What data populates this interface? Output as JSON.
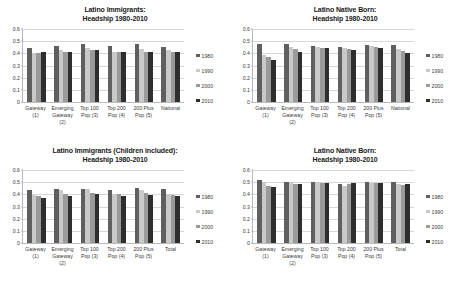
{
  "figure": {
    "background_color": "#ffffff",
    "series_colors": {
      "1980": "#5f5f5f",
      "1990": "#c9c9c9",
      "2000": "#9a9a9a",
      "2010": "#2e2e2e"
    },
    "legend_labels": [
      "1980",
      "1990",
      "2000",
      "2010"
    ],
    "yticks": [
      "0.6",
      "0.5",
      "0.4",
      "0.3",
      "0.2",
      "0.1",
      "0"
    ]
  },
  "chart_data": [
    {
      "type": "bar",
      "panel": "top-left",
      "title": "Latino Immigrants:",
      "subtitle": "Headship 1980-2010",
      "xlabel": "",
      "ylabel": "",
      "ylim": [
        0,
        0.6
      ],
      "ytick_values": [
        0,
        0.1,
        0.2,
        0.3,
        0.4,
        0.5,
        0.6
      ],
      "grid": true,
      "legend_position": "right",
      "categories": [
        [
          "Gateway",
          "(1)"
        ],
        [
          "Emerging",
          "Gateway",
          "(2)"
        ],
        [
          "Top 100",
          "Pop (3)"
        ],
        [
          "Top 200",
          "Pop (4)"
        ],
        [
          "200 Plus",
          "Pop (5)"
        ],
        [
          "National"
        ]
      ],
      "series": [
        {
          "name": "1980",
          "values": [
            0.44,
            0.46,
            0.48,
            0.46,
            0.48,
            0.455
          ]
        },
        {
          "name": "1990",
          "values": [
            0.4,
            0.43,
            0.44,
            0.415,
            0.435,
            0.425
          ]
        },
        {
          "name": "2000",
          "values": [
            0.4,
            0.41,
            0.425,
            0.41,
            0.415,
            0.41
          ]
        },
        {
          "name": "2010",
          "values": [
            0.41,
            0.41,
            0.425,
            0.415,
            0.415,
            0.41
          ]
        }
      ]
    },
    {
      "type": "bar",
      "panel": "top-right",
      "title": "Latino Native Born:",
      "subtitle": "Headship 1980-2010",
      "xlabel": "",
      "ylabel": "",
      "ylim": [
        0,
        0.6
      ],
      "ytick_values": [
        0,
        0.1,
        0.2,
        0.3,
        0.4,
        0.5,
        0.6
      ],
      "grid": true,
      "legend_position": "right",
      "categories": [
        [
          "Gateway",
          "(1)"
        ],
        [
          "Emerging",
          "Gateway",
          "(2)"
        ],
        [
          "Top 100",
          "Pop (3)"
        ],
        [
          "Top 200",
          "Pop (4)"
        ],
        [
          "200 Plus",
          "Pop (5)"
        ],
        [
          "National"
        ]
      ],
      "series": [
        {
          "name": "1980",
          "values": [
            0.48,
            0.478,
            0.458,
            0.452,
            0.465,
            0.472
          ]
        },
        {
          "name": "1990",
          "values": [
            0.39,
            0.455,
            0.45,
            0.442,
            0.458,
            0.432
          ]
        },
        {
          "name": "2000",
          "values": [
            0.37,
            0.432,
            0.442,
            0.438,
            0.452,
            0.418
          ]
        },
        {
          "name": "2010",
          "values": [
            0.345,
            0.41,
            0.44,
            0.428,
            0.445,
            0.4
          ]
        }
      ]
    },
    {
      "type": "bar",
      "panel": "bottom-left",
      "title": "Latino Immigrants (Children included):",
      "subtitle": "Headship 1980-2010",
      "xlabel": "",
      "ylabel": "",
      "ylim": [
        0,
        0.6
      ],
      "ytick_values": [
        0,
        0.1,
        0.2,
        0.3,
        0.4,
        0.5,
        0.6
      ],
      "grid": true,
      "legend_position": "right",
      "categories": [
        [
          "Gateway",
          "(1)"
        ],
        [
          "Emerging",
          "Gateway",
          "(2)"
        ],
        [
          "Top 100",
          "Pop (3)"
        ],
        [
          "Top 200",
          "Pop (4)"
        ],
        [
          "200 Plus",
          "Pop (5)"
        ],
        [
          "Total"
        ]
      ],
      "series": [
        {
          "name": "1980",
          "values": [
            0.437,
            0.445,
            0.447,
            0.432,
            0.452,
            0.44
          ]
        },
        {
          "name": "1990",
          "values": [
            0.392,
            0.435,
            0.44,
            0.405,
            0.437,
            0.405
          ]
        },
        {
          "name": "2000",
          "values": [
            0.385,
            0.405,
            0.408,
            0.4,
            0.412,
            0.392
          ]
        },
        {
          "name": "2010",
          "values": [
            0.368,
            0.39,
            0.4,
            0.388,
            0.392,
            0.383
          ]
        }
      ]
    },
    {
      "type": "bar",
      "panel": "bottom-right",
      "title": "Latino Native Born:",
      "subtitle": "Headship 1980-2010",
      "xlabel": "",
      "ylabel": "",
      "ylim": [
        0,
        0.6
      ],
      "ytick_values": [
        0,
        0.1,
        0.2,
        0.3,
        0.4,
        0.5,
        0.6
      ],
      "grid": true,
      "legend_position": "right",
      "categories": [
        [
          "Gateway",
          "(1)"
        ],
        [
          "Emerging",
          "Gateway",
          "(2)"
        ],
        [
          "Top 100",
          "Pop (3)"
        ],
        [
          "Top 200",
          "Pop (4)"
        ],
        [
          "200 Plus",
          "Pop (5)"
        ],
        [
          "Total"
        ]
      ],
      "series": [
        {
          "name": "1980",
          "values": [
            0.515,
            0.502,
            0.5,
            0.487,
            0.498,
            0.505
          ]
        },
        {
          "name": "1990",
          "values": [
            0.5,
            0.502,
            0.498,
            0.472,
            0.497,
            0.487
          ]
        },
        {
          "name": "2000",
          "values": [
            0.465,
            0.487,
            0.493,
            0.485,
            0.495,
            0.48
          ]
        },
        {
          "name": "2010",
          "values": [
            0.46,
            0.487,
            0.495,
            0.492,
            0.495,
            0.482
          ]
        }
      ]
    }
  ]
}
